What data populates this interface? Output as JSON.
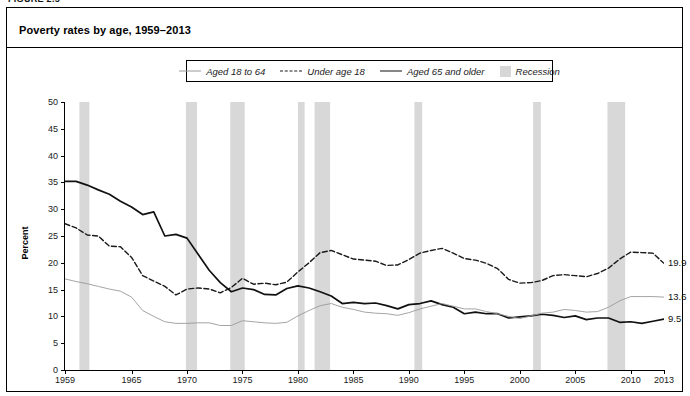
{
  "figure": {
    "number_label": "FIGURE 2.5",
    "title": "Poverty rates by age, 1959–2013"
  },
  "legend": {
    "items": [
      {
        "label": "Aged 18 to 64",
        "style": "thin-solid",
        "icon": "line-thin-icon",
        "color": "#9a9a9a"
      },
      {
        "label": "Under age 18",
        "style": "dashed",
        "icon": "line-dashed-icon",
        "color": "#1a1a1a"
      },
      {
        "label": "Aged 65 and older",
        "style": "thick-solid",
        "icon": "line-solid-icon",
        "color": "#111111"
      },
      {
        "label": "Recession",
        "style": "swatch",
        "icon": "shaded-box-icon",
        "color": "#d7d7d7"
      }
    ]
  },
  "axes": {
    "y_title": "Percent",
    "y_ticks": [
      0,
      5,
      10,
      15,
      20,
      25,
      30,
      35,
      40,
      45,
      50
    ],
    "x_ticks": [
      1959,
      1965,
      1970,
      1975,
      1980,
      1985,
      1990,
      1995,
      2000,
      2005,
      2010,
      2013
    ]
  },
  "end_labels": [
    {
      "name": "under-18-end-label",
      "value": "19.9"
    },
    {
      "name": "aged-18-64-end-label",
      "value": "13.6"
    },
    {
      "name": "aged-65-older-end-label",
      "value": "9.5"
    }
  ],
  "chart_data": {
    "type": "line",
    "title": "Poverty rates by age, 1959–2013",
    "xlabel": "",
    "ylabel": "Percent",
    "xlim": [
      1959,
      2013
    ],
    "ylim": [
      0,
      50
    ],
    "grid": false,
    "legend_position": "top-center",
    "x": [
      1959,
      1960,
      1961,
      1962,
      1963,
      1964,
      1965,
      1966,
      1967,
      1968,
      1969,
      1970,
      1971,
      1972,
      1973,
      1974,
      1975,
      1976,
      1977,
      1978,
      1979,
      1980,
      1981,
      1982,
      1983,
      1984,
      1985,
      1986,
      1987,
      1988,
      1989,
      1990,
      1991,
      1992,
      1993,
      1994,
      1995,
      1996,
      1997,
      1998,
      1999,
      2000,
      2001,
      2002,
      2003,
      2004,
      2005,
      2006,
      2007,
      2008,
      2009,
      2010,
      2011,
      2012,
      2013
    ],
    "series": [
      {
        "name": "Aged 65 and older",
        "style": "thick-solid",
        "color": "#111111",
        "end_value": 9.5,
        "values": [
          35.2,
          35.2,
          34.5,
          33.6,
          32.8,
          31.5,
          30.4,
          29.0,
          29.5,
          25.0,
          25.3,
          24.6,
          21.6,
          18.6,
          16.3,
          14.6,
          15.3,
          15.0,
          14.1,
          14.0,
          15.2,
          15.7,
          15.3,
          14.6,
          13.8,
          12.4,
          12.6,
          12.4,
          12.5,
          12.0,
          11.4,
          12.2,
          12.4,
          12.9,
          12.2,
          11.7,
          10.5,
          10.8,
          10.5,
          10.5,
          9.7,
          9.9,
          10.1,
          10.4,
          10.2,
          9.8,
          10.1,
          9.4,
          9.7,
          9.7,
          8.9,
          9.0,
          8.7,
          9.1,
          9.5
        ]
      },
      {
        "name": "Under age 18",
        "style": "dashed",
        "color": "#1a1a1a",
        "end_value": 19.9,
        "values": [
          27.3,
          26.5,
          25.2,
          25.0,
          23.1,
          23.0,
          21.0,
          17.6,
          16.6,
          15.6,
          14.0,
          15.1,
          15.3,
          15.1,
          14.4,
          15.4,
          17.1,
          16.0,
          16.2,
          15.9,
          16.4,
          18.3,
          20.0,
          21.9,
          22.3,
          21.5,
          20.7,
          20.5,
          20.3,
          19.5,
          19.6,
          20.6,
          21.8,
          22.3,
          22.7,
          21.8,
          20.8,
          20.5,
          19.9,
          18.9,
          16.9,
          16.2,
          16.3,
          16.7,
          17.6,
          17.8,
          17.6,
          17.4,
          18.0,
          19.0,
          20.7,
          22.0,
          21.9,
          21.8,
          19.9
        ]
      },
      {
        "name": "Aged 18 to 64",
        "style": "thin-solid",
        "color": "#9a9a9a",
        "end_value": 13.6,
        "values": [
          17.0,
          16.5,
          16.1,
          15.6,
          15.1,
          14.7,
          13.6,
          11.1,
          10.0,
          9.0,
          8.7,
          8.7,
          8.8,
          8.8,
          8.3,
          8.3,
          9.2,
          9.0,
          8.8,
          8.7,
          8.9,
          10.1,
          11.1,
          12.0,
          12.4,
          11.7,
          11.3,
          10.8,
          10.6,
          10.5,
          10.2,
          10.7,
          11.4,
          11.9,
          12.4,
          11.9,
          11.4,
          11.4,
          10.9,
          10.5,
          10.0,
          9.6,
          10.1,
          10.6,
          10.8,
          11.3,
          11.1,
          10.8,
          10.9,
          11.7,
          12.9,
          13.7,
          13.7,
          13.7,
          13.6
        ]
      }
    ],
    "recession_bands": [
      {
        "start": 1960.3,
        "end": 1961.2
      },
      {
        "start": 1969.9,
        "end": 1970.9
      },
      {
        "start": 1973.9,
        "end": 1975.2
      },
      {
        "start": 1980.0,
        "end": 1980.6
      },
      {
        "start": 1981.5,
        "end": 1982.9
      },
      {
        "start": 1990.5,
        "end": 1991.2
      },
      {
        "start": 2001.2,
        "end": 2001.9
      },
      {
        "start": 2007.9,
        "end": 2009.5
      }
    ],
    "recession_color": "#d8d8d8"
  }
}
